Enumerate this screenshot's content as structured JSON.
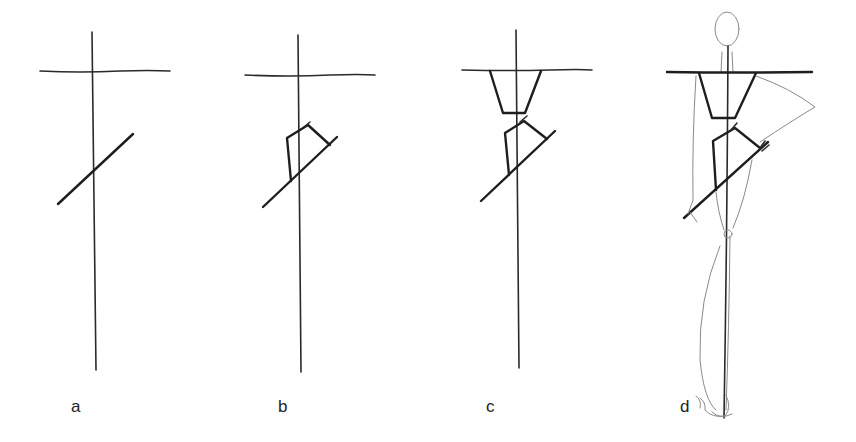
{
  "figure": {
    "panels": [
      {
        "id": "a",
        "label": "a"
      },
      {
        "id": "b",
        "label": "b"
      },
      {
        "id": "c",
        "label": "c"
      },
      {
        "id": "d",
        "label": "d"
      }
    ]
  },
  "colors": {
    "background": "#ffffff",
    "ink": "#2a2a2a",
    "sketch": "#8a8a8a"
  }
}
